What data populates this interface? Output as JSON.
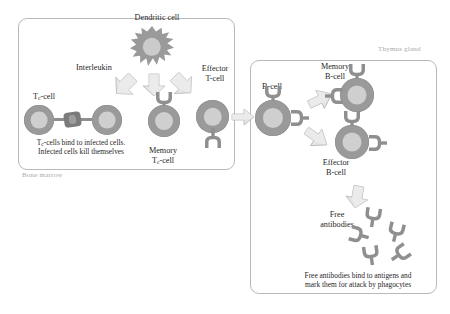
{
  "figure": {
    "type": "biological-process-diagram"
  },
  "panels": {
    "bone_marrow": {
      "caption": "Bone marrow"
    },
    "thymus": {
      "caption": "Thymus gland"
    }
  },
  "labels": {
    "dendritic_cell": "Dendritic cell",
    "interleukin": "Interleukin",
    "tc_cell": "T",
    "tc_cell_sub": "c",
    "tc_cell_tail": "-cell",
    "tc_note_line1": "T",
    "tc_note_sub": "c",
    "tc_note_line1_tail": "-cells bind to infected cells.",
    "tc_note_line2": "Infected cells kill themselves",
    "memory_tc_line1": "Memory",
    "memory_tc_line2": "T",
    "memory_tc_sub": "c",
    "memory_tc_line2_tail": "-cell",
    "effector_t_line1": "Effector",
    "effector_t_line2": "T-cell",
    "b_cell": "B-cell",
    "memory_b_line1": "Memory",
    "memory_b_line2": "B-cell",
    "effector_b_line1": "Effector",
    "effector_b_line2": "B-cell",
    "free_antibodies_line1": "Free",
    "free_antibodies_line2": "antibodies",
    "antibody_note_line1": "Free antibodies bind to antigens and",
    "antibody_note_line2": "mark them for attack by phagocytes"
  },
  "colors": {
    "cell_body": "#9a9a9a",
    "cell_nucleus": "#cfcfcf",
    "arrow_fill": "#e3e3e3",
    "arrow_stroke": "#b5b5b5",
    "panel_border": "#b9b9b9",
    "caption_text": "#a9a9a9",
    "label_text": "#1f1f1f",
    "background": "#ffffff"
  },
  "icons": {
    "dendritic": "spiky-star-cell-icon",
    "tc_pair": "paired-cell-icon",
    "memory_tc": "memory-t-cell-icon",
    "effector_t": "effector-t-cell-icon",
    "b_cell": "b-cell-icon",
    "memory_b": "memory-b-cell-icon",
    "effector_b": "effector-b-cell-icon",
    "antibody": "y-antibody-icon",
    "arrow": "block-arrow-icon"
  },
  "arrows": [
    {
      "name": "dendritic-to-tc",
      "from": "dendritic_cell",
      "to": "tc_cell"
    },
    {
      "name": "dendritic-to-memory-tc",
      "from": "dendritic_cell",
      "to": "memory_tc_cell"
    },
    {
      "name": "dendritic-to-effector-t",
      "from": "dendritic_cell",
      "to": "effector_t_cell"
    },
    {
      "name": "effector-t-to-b-cell",
      "from": "effector_t_cell",
      "to": "b_cell"
    },
    {
      "name": "b-cell-to-memory-b",
      "from": "b_cell",
      "to": "memory_b_cell"
    },
    {
      "name": "b-cell-to-effector-b",
      "from": "b_cell",
      "to": "effector_b_cell"
    },
    {
      "name": "effector-b-to-antibodies",
      "from": "effector_b_cell",
      "to": "free_antibodies"
    }
  ]
}
